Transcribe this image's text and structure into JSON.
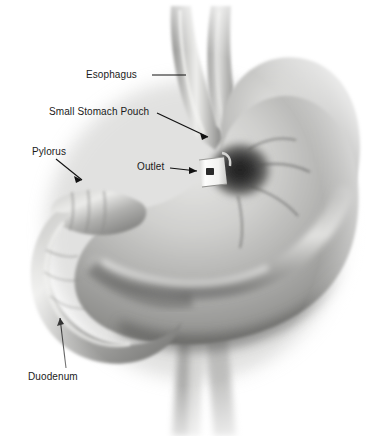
{
  "figure": {
    "modality": "grayscale medical illustration",
    "background_color": "#ffffff",
    "label_color": "#1a1a1a",
    "leader_color": "#111111"
  },
  "labels": {
    "esophagus": "Esophagus",
    "small_stomach_pouch": "Small Stomach Pouch",
    "pylorus": "Pylorus",
    "outlet": "Outlet",
    "duodenum": "Duodenum"
  },
  "anatomy": {
    "esophagus_name": "esophagus-tube",
    "vagus_tube_name": "secondary-tube",
    "fundus_name": "gastric-fundus",
    "body_name": "gastric-body",
    "antrum_name": "gastric-antrum",
    "pylorus_name": "pyloric-sphincter",
    "duodenum_name": "duodenal-loop",
    "band_name": "gastric-band-device",
    "outlet_name": "stoma-outlet",
    "lower_tubes_name": "lower-vessels"
  },
  "palette": {
    "tissue_light": "#d8d8d6",
    "tissue_mid": "#a9a9a7",
    "tissue_dark": "#6e6e6c",
    "tissue_shadow": "#3f3f3e",
    "highlight": "#efefed",
    "band_white": "#fbfbfa",
    "band_buckle": "#2a2a2a",
    "vignette": "#f2f2f1"
  }
}
